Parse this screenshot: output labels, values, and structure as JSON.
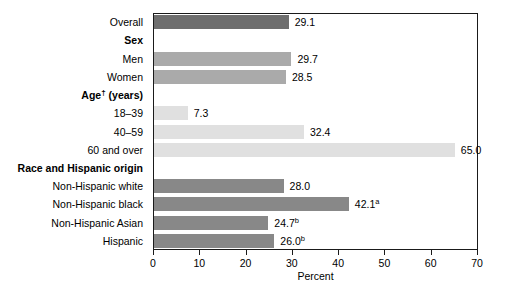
{
  "chart_data": {
    "type": "bar",
    "orientation": "horizontal",
    "title": "",
    "xlabel": "Percent",
    "ylabel": "",
    "xlim": [
      0,
      70
    ],
    "xticks": [
      0,
      10,
      20,
      30,
      40,
      50,
      60,
      70
    ],
    "xtick_labels": [
      "0",
      "10",
      "20",
      "30",
      "40",
      "50",
      "60",
      "70"
    ],
    "grid": false,
    "legend": "none",
    "rows": [
      {
        "kind": "bar",
        "label": "Overall",
        "label_sup": "",
        "value": 29.1,
        "value_label": "29.1",
        "value_sup": "",
        "color": "#6e6e6e"
      },
      {
        "kind": "header",
        "label": "Sex",
        "label_sup": "",
        "value": null,
        "value_label": "",
        "value_sup": "",
        "color": ""
      },
      {
        "kind": "bar",
        "label": "Men",
        "label_sup": "",
        "value": 29.7,
        "value_label": "29.7",
        "value_sup": "",
        "color": "#aaaaaa"
      },
      {
        "kind": "bar",
        "label": "Women",
        "label_sup": "",
        "value": 28.5,
        "value_label": "28.5",
        "value_sup": "",
        "color": "#aaaaaa"
      },
      {
        "kind": "header",
        "label": "Age",
        "label_sup": "†",
        "label_tail": " (years)",
        "value": null,
        "value_label": "",
        "value_sup": "",
        "color": ""
      },
      {
        "kind": "bar",
        "label": "18–39",
        "label_sup": "",
        "value": 7.3,
        "value_label": "7.3",
        "value_sup": "",
        "color": "#e0e0e0"
      },
      {
        "kind": "bar",
        "label": "40–59",
        "label_sup": "",
        "value": 32.4,
        "value_label": "32.4",
        "value_sup": "",
        "color": "#e0e0e0"
      },
      {
        "kind": "bar",
        "label": "60 and over",
        "label_sup": "",
        "value": 65.0,
        "value_label": "65.0",
        "value_sup": "",
        "color": "#e0e0e0"
      },
      {
        "kind": "header",
        "label": "Race and Hispanic origin",
        "label_sup": "",
        "value": null,
        "value_label": "",
        "value_sup": "",
        "color": ""
      },
      {
        "kind": "bar",
        "label": "Non-Hispanic white",
        "label_sup": "",
        "value": 28.0,
        "value_label": "28.0",
        "value_sup": "",
        "color": "#888888"
      },
      {
        "kind": "bar",
        "label": "Non-Hispanic black",
        "label_sup": "",
        "value": 42.1,
        "value_label": "42.1",
        "value_sup": "a",
        "color": "#888888"
      },
      {
        "kind": "bar",
        "label": "Non-Hispanic Asian",
        "label_sup": "",
        "value": 24.7,
        "value_label": "24.7",
        "value_sup": "b",
        "color": "#888888"
      },
      {
        "kind": "bar",
        "label": "Hispanic",
        "label_sup": "",
        "value": 26.0,
        "value_label": "26.0",
        "value_sup": "b",
        "color": "#888888"
      }
    ],
    "series": [
      {
        "name": "Percent",
        "categories": [
          "Overall",
          "Men",
          "Women",
          "18–39",
          "40–59",
          "60 and over",
          "Non-Hispanic white",
          "Non-Hispanic black",
          "Non-Hispanic Asian",
          "Hispanic"
        ],
        "values": [
          29.1,
          29.7,
          28.5,
          7.3,
          32.4,
          65.0,
          28.0,
          42.1,
          24.7,
          26.0
        ]
      }
    ],
    "colors": {
      "overall": "#6e6e6e",
      "sex": "#aaaaaa",
      "age": "#e0e0e0",
      "race": "#888888",
      "axis": "#1a1a1a",
      "text": "#000000",
      "background": "#ffffff"
    }
  }
}
